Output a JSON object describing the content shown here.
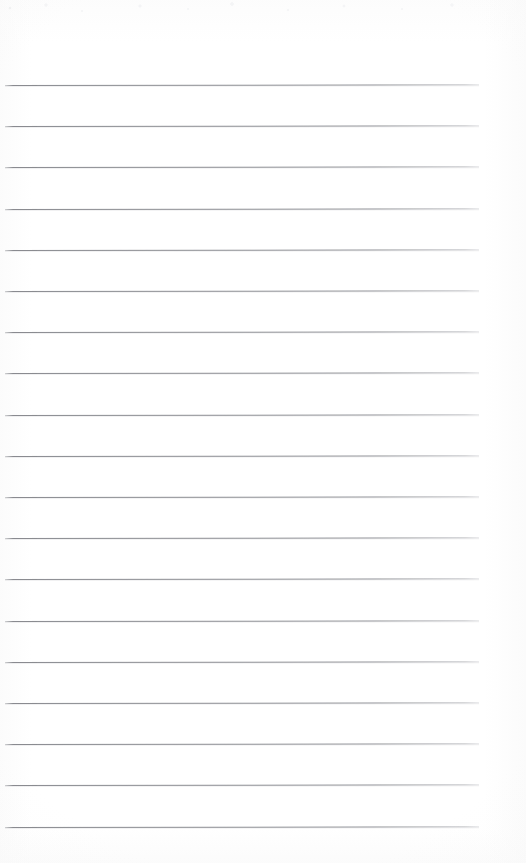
{
  "document": {
    "kind": "scanned-blank-lined-page",
    "title": "Blank Lined Notepad Page",
    "page_width": 526,
    "page_height": 863,
    "background_color": "#ffffff",
    "has_text_content": false,
    "has_header": false,
    "has_footer": false,
    "has_page_number": false,
    "has_margin_rule": false
  },
  "ruling": {
    "line_count": 19,
    "line_color": "#85878c",
    "line_thickness_px": 1,
    "line_spacing_px": 41.2,
    "first_line_y": 85,
    "last_line_y": 826.6,
    "line_start_x": 5,
    "line_end_x": 479,
    "line_length_px": 474,
    "skew_degrees": -0.085,
    "top_margin_px": 85,
    "bottom_margin_px": 36,
    "left_margin_px": 5,
    "right_margin_px": 47
  },
  "lines": [
    {
      "index": 1,
      "y": 85.0,
      "x_start": 5,
      "x_end": 479
    },
    {
      "index": 2,
      "y": 126.2,
      "x_start": 5,
      "x_end": 479
    },
    {
      "index": 3,
      "y": 167.4,
      "x_start": 5,
      "x_end": 479
    },
    {
      "index": 4,
      "y": 208.6,
      "x_start": 5,
      "x_end": 479
    },
    {
      "index": 5,
      "y": 249.8,
      "x_start": 5,
      "x_end": 479
    },
    {
      "index": 6,
      "y": 291.0,
      "x_start": 5,
      "x_end": 479
    },
    {
      "index": 7,
      "y": 332.2,
      "x_start": 5,
      "x_end": 479
    },
    {
      "index": 8,
      "y": 373.4,
      "x_start": 5,
      "x_end": 479
    },
    {
      "index": 9,
      "y": 414.6,
      "x_start": 5,
      "x_end": 479
    },
    {
      "index": 10,
      "y": 455.8,
      "x_start": 5,
      "x_end": 479
    },
    {
      "index": 11,
      "y": 497.0,
      "x_start": 5,
      "x_end": 479
    },
    {
      "index": 12,
      "y": 538.2,
      "x_start": 5,
      "x_end": 479
    },
    {
      "index": 13,
      "y": 579.4,
      "x_start": 5,
      "x_end": 479
    },
    {
      "index": 14,
      "y": 620.6,
      "x_start": 5,
      "x_end": 479
    },
    {
      "index": 15,
      "y": 661.8,
      "x_start": 5,
      "x_end": 479
    },
    {
      "index": 16,
      "y": 703.0,
      "x_start": 5,
      "x_end": 479
    },
    {
      "index": 17,
      "y": 744.2,
      "x_start": 5,
      "x_end": 479
    },
    {
      "index": 18,
      "y": 785.4,
      "x_start": 5,
      "x_end": 479
    },
    {
      "index": 19,
      "y": 826.6,
      "x_start": 5,
      "x_end": 479
    }
  ]
}
